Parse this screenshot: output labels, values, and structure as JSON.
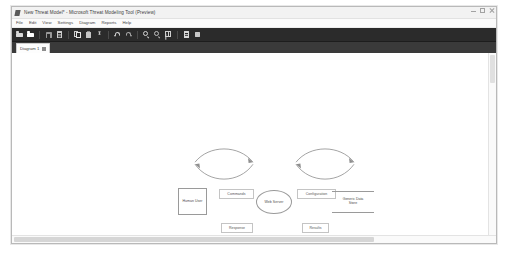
{
  "window": {
    "title": "New Threat Model* - Microsoft Threat Modeling Tool (Preview)",
    "app_icon": "app-icon",
    "controls": {
      "minimize": "minimize",
      "maximize": "maximize",
      "close": "close"
    }
  },
  "menu": {
    "items": [
      {
        "label": "File"
      },
      {
        "label": "Edit"
      },
      {
        "label": "View"
      },
      {
        "label": "Settings"
      },
      {
        "label": "Diagram"
      },
      {
        "label": "Reports"
      },
      {
        "label": "Help"
      }
    ]
  },
  "toolbar": {
    "buttons": [
      {
        "icon": "open-folder-icon",
        "group": 1
      },
      {
        "icon": "new-folder-icon",
        "group": 1
      },
      {
        "icon": "save-icon",
        "group": 2
      },
      {
        "icon": "document-icon",
        "group": 2
      },
      {
        "icon": "copy-icon",
        "group": 3
      },
      {
        "icon": "paste-icon",
        "group": 3
      },
      {
        "icon": "cut-icon",
        "group": 3
      },
      {
        "icon": "undo-icon",
        "group": 4
      },
      {
        "icon": "redo-icon",
        "group": 4
      },
      {
        "icon": "zoom-in-icon",
        "group": 5
      },
      {
        "icon": "zoom-out-icon",
        "group": 5
      },
      {
        "icon": "grid-icon",
        "group": 5
      },
      {
        "icon": "report-icon",
        "group": 6
      },
      {
        "icon": "analyze-icon",
        "group": 6
      }
    ]
  },
  "tabs": {
    "items": [
      {
        "label": "Diagram 1",
        "close_icon": "close-icon",
        "active": true
      }
    ]
  },
  "diagram": {
    "nodes": [
      {
        "id": "human-user",
        "label": "Human User",
        "type": "external-entity"
      },
      {
        "id": "web-server",
        "label": "Web Server",
        "type": "process"
      },
      {
        "id": "generic-data-store",
        "label": "Generic Data\nStore",
        "type": "data-store"
      }
    ],
    "flows": [
      {
        "id": "commands",
        "label": "Commands",
        "from": "human-user",
        "to": "web-server"
      },
      {
        "id": "response",
        "label": "Response",
        "from": "web-server",
        "to": "human-user"
      },
      {
        "id": "configuration",
        "label": "Configuration",
        "from": "web-server",
        "to": "generic-data-store"
      },
      {
        "id": "results",
        "label": "Results",
        "from": "generic-data-store",
        "to": "web-server"
      }
    ]
  },
  "scrollbars": {
    "vertical": "vertical-scrollbar",
    "horizontal": "horizontal-scrollbar"
  },
  "colors": {
    "toolbar_bg": "#2b2b2b",
    "tabstrip_bg": "#3a3a3a",
    "canvas_bg": "#ffffff",
    "shape_stroke": "#9a9a9a",
    "text": "#4a4a4a"
  }
}
